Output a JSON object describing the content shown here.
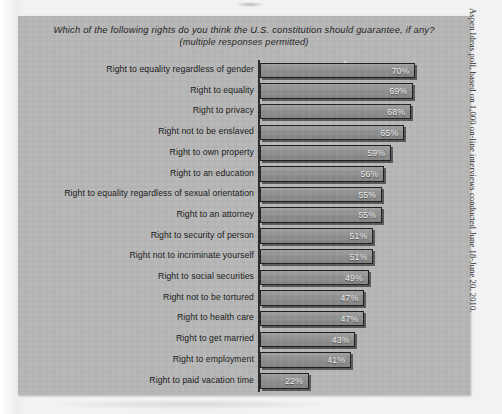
{
  "chart_data": {
    "type": "bar",
    "orientation": "horizontal",
    "title": "Which of the following rights do you think the U.S. constitution should guarantee, if any?",
    "subtitle": "(multiple responses permitted)",
    "xlabel": "",
    "ylabel": "",
    "xlim": [
      0,
      100
    ],
    "grid": false,
    "legend": false,
    "value_suffix": "%",
    "categories": [
      "Right to equality regardless of gender",
      "Right to equality",
      "Right to privacy",
      "Right not to be enslaved",
      "Right to own property",
      "Right to an education",
      "Right to equality regardless of sexual orientation",
      "Right to an attorney",
      "Right to security of person",
      "Right not to incriminate yourself",
      "Right to social securities",
      "Right not to be tortured",
      "Right to health care",
      "Right to get married",
      "Right to employment",
      "Right to paid vacation time"
    ],
    "values": [
      70,
      69,
      68,
      65,
      59,
      56,
      55,
      55,
      51,
      51,
      49,
      47,
      47,
      43,
      41,
      22
    ],
    "value_labels": [
      "70%",
      "69%",
      "68%",
      "65%",
      "59%",
      "56%",
      "55%",
      "55%",
      "51%",
      "51%",
      "49%",
      "47%",
      "47%",
      "43%",
      "41%",
      "22%"
    ],
    "colors": {
      "panel_background": "#b6b6b6",
      "bar_fill": "#8e8e8e",
      "bar_border": "#1e1e1e",
      "value_text": "#f0f0f0",
      "label_text": "#171717"
    }
  },
  "source": {
    "caption": "Aspen Ideas poll, based on 1,000 on-line interviews conducted June 18-June 20, 2010."
  }
}
